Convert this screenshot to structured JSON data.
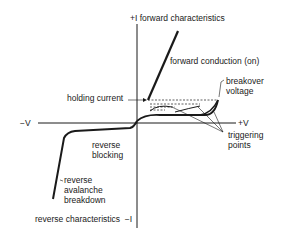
{
  "diagram": {
    "axes": {
      "y_positive": "+I",
      "y_positive_caption": "forward characteristics",
      "y_negative": "−I",
      "y_negative_caption": "reverse characteristics",
      "x_positive": "+V",
      "x_negative": "−V"
    },
    "labels": {
      "forward_conduction": "forward conduction (on)",
      "breakover_line1": "breakover",
      "breakover_line2": "voltage",
      "holding_current": "holding current",
      "triggering_line1": "triggering",
      "triggering_line2": "points",
      "reverse_blocking_line1": "reverse",
      "reverse_blocking_line2": "blocking",
      "avalanche_line1": "reverse",
      "avalanche_line2": "avalanche",
      "avalanche_line3": "breakdown"
    },
    "colors": {
      "ink": "#1a1a1a",
      "background": "#ffffff"
    }
  }
}
